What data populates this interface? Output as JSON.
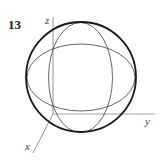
{
  "figure": {
    "number": "13",
    "axes": {
      "x_label": "x",
      "y_label": "y",
      "z_label": "z"
    },
    "sphere": {
      "cx": 81,
      "cy": 77,
      "r": 55
    },
    "vertical_ellipse": {
      "cx": 80.5,
      "cy": 77.5,
      "rx": 32,
      "ry": 55
    },
    "horizontal_ellipse": {
      "cx": 81,
      "cy": 77.5,
      "rx": 54,
      "ry": 33.5
    },
    "colors": {
      "outline": "#1a1a1a",
      "thin_line": "#555555",
      "axis": "#777777"
    }
  }
}
